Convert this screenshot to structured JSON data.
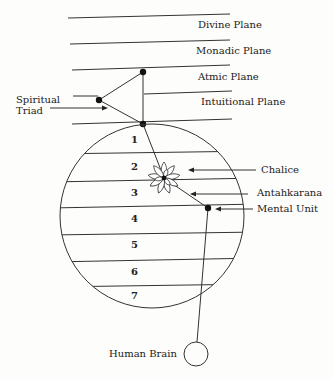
{
  "diagram": {
    "planes": [
      {
        "label": "Divine Plane"
      },
      {
        "label": "Monadic Plane"
      },
      {
        "label": "Atmic Plane"
      },
      {
        "label": "Intuitional Plane"
      }
    ],
    "mental_subplanes": [
      "1",
      "2",
      "3",
      "4",
      "5",
      "6",
      "7"
    ],
    "labels": {
      "spiritual_triad_line1": "Spiritual",
      "spiritual_triad_line2": "Triad",
      "chalice": "Chalice",
      "antahkarana": "Antahkarana",
      "mental_unit": "Mental Unit",
      "human_brain": "Human Brain"
    },
    "colors": {
      "line": "#333333",
      "background": "#fdfdfb"
    }
  }
}
